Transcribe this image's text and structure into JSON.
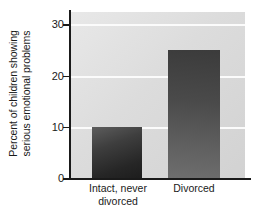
{
  "chart_data": {
    "type": "bar",
    "title": "",
    "xlabel": "",
    "ylabel_line1": "Percent of children showing",
    "ylabel_line2": "serious emotional problems",
    "ylabel": "Percent of children showing serious emotional problems",
    "categories": [
      "Intact, never divorced",
      "Divorced"
    ],
    "category_lines": [
      [
        "Intact, never",
        "divorced"
      ],
      [
        "Divorced"
      ]
    ],
    "values": [
      10,
      25
    ],
    "ylim": [
      0,
      32.4
    ],
    "yticks": [
      0,
      10,
      20,
      30
    ],
    "ytick_labels": [
      "0",
      "10",
      "20",
      "30"
    ],
    "grid": true,
    "gridlines_at": [
      10,
      20,
      30
    ],
    "legend": "none",
    "colors": {
      "bar_dark": "#262626",
      "bar_light": "#6e6e6e",
      "plot_background": "#dcdcdc",
      "gridline": "#fbfbfb",
      "axis": "#1a1a1a",
      "text": "#1a1a1a"
    }
  }
}
